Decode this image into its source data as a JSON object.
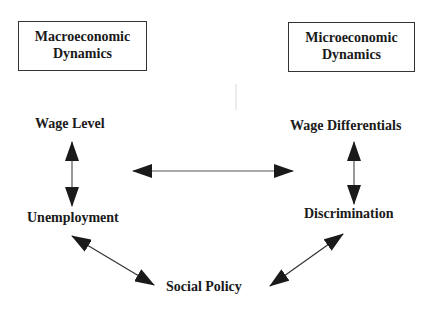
{
  "diagram": {
    "boxes": [
      {
        "id": "macro",
        "line1": "Macroeconomic",
        "line2": "Dynamics"
      },
      {
        "id": "micro",
        "line1": "Microeconomic",
        "line2": "Dynamics"
      }
    ],
    "nodes": {
      "wage_level": "Wage Level",
      "unemployment": "Unemployment",
      "wage_differentials": "Wage Differentials",
      "discrimination": "Discrimination",
      "social_policy": "Social Policy"
    },
    "edges": [
      {
        "from": "Wage Level",
        "to": "Unemployment",
        "type": "bidirectional"
      },
      {
        "from": "Wage Differentials",
        "to": "Discrimination",
        "type": "bidirectional"
      },
      {
        "from": "Macro side",
        "to": "Micro side",
        "type": "bidirectional"
      },
      {
        "from": "Unemployment",
        "to": "Social Policy",
        "type": "bidirectional"
      },
      {
        "from": "Discrimination",
        "to": "Social Policy",
        "type": "bidirectional"
      }
    ],
    "colors": {
      "line": "#333333",
      "arrowhead": "#1a1a1a",
      "background": "#ffffff"
    }
  }
}
